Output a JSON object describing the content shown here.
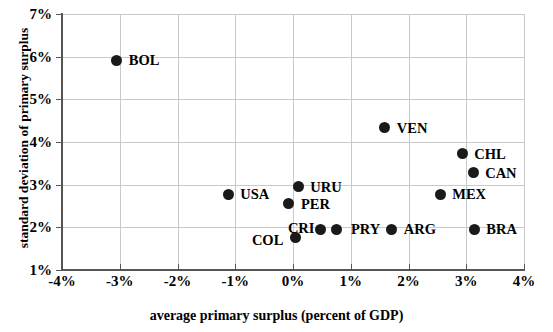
{
  "chart_data": {
    "type": "scatter",
    "title": "",
    "xlabel": "average primary surplus (percent of GDP)",
    "ylabel": "standard deviation of primary surplus",
    "xlim": [
      -4,
      4
    ],
    "ylim": [
      1,
      7
    ],
    "xticks": [
      "-4%",
      "-3%",
      "-2%",
      "-1%",
      "0%",
      "1%",
      "2%",
      "3%",
      "4%"
    ],
    "xtick_values": [
      -4,
      -3,
      -2,
      -1,
      0,
      1,
      2,
      3,
      4
    ],
    "yticks": [
      "1%",
      "2%",
      "3%",
      "4%",
      "5%",
      "6%",
      "7%"
    ],
    "ytick_values": [
      1,
      2,
      3,
      4,
      5,
      6,
      7
    ],
    "grid": true,
    "legend": "none",
    "unit": "percent of GDP",
    "points": [
      {
        "label": "BOL",
        "x": -3.05,
        "y": 5.92,
        "label_dx": 12,
        "label_dy": -7
      },
      {
        "label": "VEN",
        "x": 1.59,
        "y": 4.33,
        "label_dx": 12,
        "label_dy": -7
      },
      {
        "label": "CHL",
        "x": 2.93,
        "y": 3.73,
        "label_dx": 12,
        "label_dy": -7
      },
      {
        "label": "CAN",
        "x": 3.12,
        "y": 3.28,
        "label_dx": 12,
        "label_dy": -7
      },
      {
        "label": "MEX",
        "x": 2.55,
        "y": 2.78,
        "label_dx": 12,
        "label_dy": -7
      },
      {
        "label": "URU",
        "x": 0.09,
        "y": 2.95,
        "label_dx": 12,
        "label_dy": -7
      },
      {
        "label": "PER",
        "x": -0.07,
        "y": 2.55,
        "label_dx": 12,
        "label_dy": -7
      },
      {
        "label": "USA",
        "x": -1.12,
        "y": 2.78,
        "label_dx": 12,
        "label_dy": -7
      },
      {
        "label": "CRI",
        "x": 0.05,
        "y": 1.77,
        "label_dx": -8,
        "label_dy": -16
      },
      {
        "label": "COL",
        "x": 0.05,
        "y": 1.77,
        "label_dx": -44,
        "label_dy": -4,
        "hide_marker": true
      },
      {
        "label": "",
        "x": 0.48,
        "y": 1.95,
        "label_dx": 0,
        "label_dy": 0
      },
      {
        "label": "",
        "x": 0.76,
        "y": 1.95,
        "label_dx": 0,
        "label_dy": 0
      },
      {
        "label": "PRY",
        "x": 0.76,
        "y": 1.95,
        "label_dx": 14,
        "label_dy": -7,
        "hide_marker": true
      },
      {
        "label": "ARG",
        "x": 1.71,
        "y": 1.95,
        "label_dx": 12,
        "label_dy": -7
      },
      {
        "label": "BRA",
        "x": 3.14,
        "y": 1.95,
        "label_dx": 12,
        "label_dy": -7
      }
    ]
  },
  "colors": {
    "marker": "#1a1a1a",
    "grid": "#c9c9c9",
    "axis": "#555555",
    "background": "#ffffff",
    "text": "#000000"
  }
}
